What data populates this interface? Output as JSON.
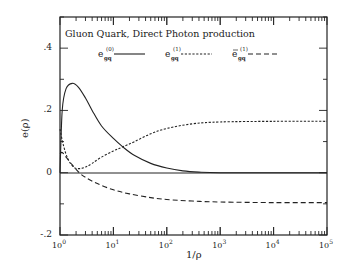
{
  "chart_data": {
    "type": "line",
    "title": "Gluon Quark, Direct Photon production",
    "xlabel": "1/ρ",
    "ylabel": "e(ρ)",
    "xscale": "log",
    "xlim": [
      1,
      100000
    ],
    "ylim": [
      -0.2,
      0.5
    ],
    "x_tick_labels": [
      "10^0",
      "10^1",
      "10^2",
      "10^3",
      "10^4",
      "10^5"
    ],
    "y_tick_labels": [
      "-.2",
      "0",
      ".2",
      ".4"
    ],
    "y_tick_values": [
      -0.2,
      0,
      0.2,
      0.4
    ],
    "grid": false,
    "legend_position": "top, inside",
    "series": [
      {
        "name": "e_gq^(0)",
        "style": "solid",
        "x": [
          1.0,
          1.1,
          1.3,
          1.7,
          2.2,
          3,
          4,
          6,
          10,
          15,
          25,
          50,
          100,
          200,
          400,
          1000,
          10000,
          100000
        ],
        "y": [
          0.0,
          0.2,
          0.27,
          0.287,
          0.275,
          0.24,
          0.2,
          0.15,
          0.11,
          0.083,
          0.055,
          0.03,
          0.015,
          0.006,
          0.002,
          0.0,
          0.0,
          0.0
        ]
      },
      {
        "name": "e_gq^(1)",
        "style": "dotted",
        "x": [
          1.0,
          1.15,
          1.4,
          1.8,
          2.3,
          3,
          4,
          6,
          10,
          15,
          25,
          50,
          100,
          300,
          1000,
          10000,
          100000
        ],
        "y": [
          0.14,
          0.09,
          0.045,
          0.018,
          0.013,
          0.018,
          0.03,
          0.05,
          0.07,
          0.083,
          0.1,
          0.125,
          0.142,
          0.157,
          0.163,
          0.165,
          0.165
        ]
      },
      {
        "name": "ē_gq^(1)",
        "style": "dashed",
        "x": [
          1.0,
          1.1,
          1.3,
          1.7,
          2.3,
          3,
          5,
          10,
          20,
          50,
          100,
          300,
          1000,
          10000,
          100000
        ],
        "y": [
          0.06,
          0.065,
          0.05,
          0.025,
          0.0,
          -0.015,
          -0.035,
          -0.055,
          -0.068,
          -0.08,
          -0.086,
          -0.091,
          -0.094,
          -0.096,
          -0.096
        ]
      }
    ],
    "legend": [
      {
        "base": "e",
        "sub": "gq",
        "sup": "(0)",
        "bar": false,
        "style": "solid"
      },
      {
        "base": "e",
        "sub": "gq",
        "sup": "(1)",
        "bar": false,
        "style": "dotted"
      },
      {
        "base": "e",
        "sub": "gq",
        "sup": "(1)",
        "bar": true,
        "style": "dashed"
      }
    ]
  }
}
